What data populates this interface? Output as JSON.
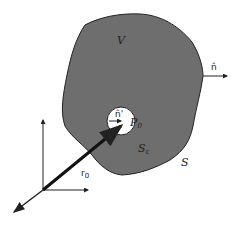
{
  "diagram": {
    "type": "volume-with-excluded-sphere",
    "region_fill": "#6e6e6e",
    "labels": {
      "volume": "V",
      "outer_normal": "n̂",
      "inner_normal": "n̂'",
      "point": "P",
      "point_sub": "0",
      "inner_surface": "S",
      "inner_surface_sub": "ε",
      "outer_surface": "S",
      "position_vector": "r",
      "position_vector_sub": "0"
    }
  }
}
